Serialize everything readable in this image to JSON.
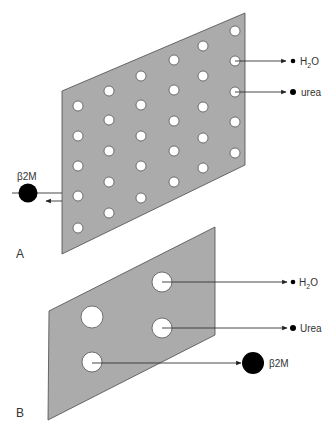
{
  "figure": {
    "panels": [
      {
        "id": "A",
        "label": "A",
        "label_pos": [
          16,
          258
        ],
        "membrane": {
          "points": [
            [
              62,
              91
            ],
            [
              245,
              13
            ],
            [
              245,
              165
            ],
            [
              62,
              254
            ]
          ],
          "fill": "#ababab"
        },
        "pore_radius": 5,
        "pores": [
          [
            78,
            106
          ],
          [
            78,
            136
          ],
          [
            78,
            166
          ],
          [
            78,
            196
          ],
          [
            78,
            228
          ],
          [
            109,
            91
          ],
          [
            109,
            120
          ],
          [
            109,
            151
          ],
          [
            109,
            182
          ],
          [
            109,
            213
          ],
          [
            141,
            76
          ],
          [
            141,
            105
          ],
          [
            141,
            136
          ],
          [
            141,
            166
          ],
          [
            141,
            198
          ],
          [
            174,
            60
          ],
          [
            174,
            90
          ],
          [
            174,
            121
          ],
          [
            174,
            151
          ],
          [
            174,
            182
          ],
          [
            203,
            46
          ],
          [
            203,
            76
          ],
          [
            203,
            107
          ],
          [
            203,
            138
          ],
          [
            203,
            168
          ],
          [
            235,
            31
          ],
          [
            235,
            61
          ],
          [
            235,
            92
          ],
          [
            235,
            122
          ],
          [
            235,
            153
          ]
        ],
        "flows": [
          {
            "name": "H2O",
            "label_main": "H",
            "label_sub": "2",
            "label_tail": "O",
            "y": 61,
            "x1": 235,
            "x2": 286,
            "dot_x": 293,
            "dot_r": 2.3,
            "text_x": 300,
            "passes": true
          },
          {
            "name": "urea",
            "label_main": "urea",
            "y": 92,
            "x1": 235,
            "x2": 286,
            "dot_x": 293,
            "dot_r": 3,
            "text_x": 301,
            "passes": true
          }
        ],
        "blocked": {
          "name": "β2M",
          "label": "β2M",
          "circle": [
            28,
            193
          ],
          "r": 9.5,
          "label_pos": [
            17,
            180
          ],
          "line_y": 193,
          "line_x1": 12,
          "line_x2": 62,
          "arrow_y": 201,
          "arrow_x1": 62,
          "arrow_x2": 46,
          "passes": false
        }
      },
      {
        "id": "B",
        "label": "B",
        "label_pos": [
          16,
          417
        ],
        "membrane": {
          "points": [
            [
              49,
              311
            ],
            [
              215,
              227
            ],
            [
              215,
              335
            ],
            [
              48,
              420
            ]
          ],
          "fill": "#ababab"
        },
        "pores_large": [
          {
            "c": [
              162,
              282
            ],
            "r": 10
          },
          {
            "c": [
              92,
              317
            ],
            "r": 11
          },
          {
            "c": [
              162,
              328
            ],
            "r": 10
          },
          {
            "c": [
              92,
              362
            ],
            "r": 10
          }
        ],
        "flows": [
          {
            "name": "H2O",
            "label_main": "H",
            "label_sub": "2",
            "label_tail": "O",
            "y": 282,
            "x1": 162,
            "x2": 287,
            "dot_x": 293,
            "dot_r": 2.3,
            "text_x": 299,
            "passes": true
          },
          {
            "name": "Urea",
            "label_main": "Urea",
            "y": 328,
            "x1": 162,
            "x2": 287,
            "dot_x": 293,
            "dot_r": 3,
            "text_x": 300,
            "passes": true
          },
          {
            "name": "β2M",
            "label_main": "β2M",
            "y": 363,
            "x1": 92,
            "x2": 241,
            "circle": [
              253,
              363
            ],
            "r": 11,
            "text_x": 269,
            "passes": true
          }
        ]
      }
    ],
    "colors": {
      "membrane": "#ababab",
      "line": "#333333",
      "solute": "#000000",
      "pore": "#ffffff",
      "text": "#333333"
    }
  }
}
